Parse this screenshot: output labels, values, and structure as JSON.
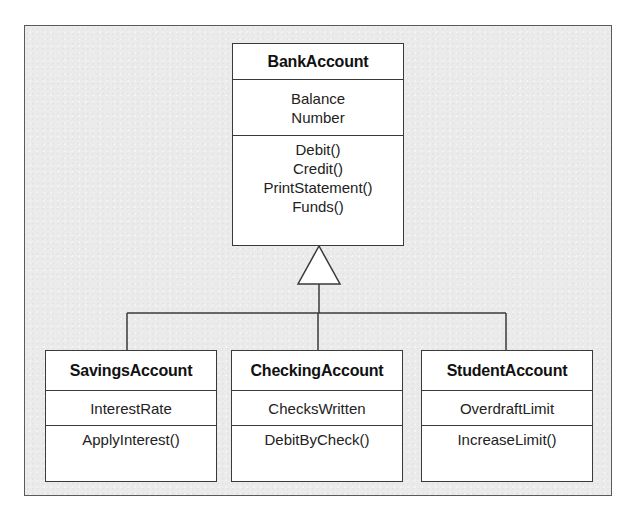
{
  "diagram": {
    "type": "UML class diagram (inheritance / generalization)",
    "colors": {
      "background": "#ebebeb",
      "box_fill": "#ffffff",
      "line": "#3a3a3a"
    },
    "parent": {
      "name": "BankAccount",
      "attributes": [
        "Balance",
        "Number"
      ],
      "operations": [
        "Debit()",
        "Credit()",
        "PrintStatement()",
        "Funds()"
      ]
    },
    "children": [
      {
        "name": "SavingsAccount",
        "attributes": [
          "InterestRate"
        ],
        "operations": [
          "ApplyInterest()"
        ]
      },
      {
        "name": "CheckingAccount",
        "attributes": [
          "ChecksWritten"
        ],
        "operations": [
          "DebitByCheck()"
        ]
      },
      {
        "name": "StudentAccount",
        "attributes": [
          "OverdraftLimit"
        ],
        "operations": [
          "IncreaseLimit()"
        ]
      }
    ],
    "relationship": {
      "kind": "generalization",
      "arrowhead": "hollow-triangle",
      "from": [
        "SavingsAccount",
        "CheckingAccount",
        "StudentAccount"
      ],
      "to": "BankAccount"
    }
  }
}
